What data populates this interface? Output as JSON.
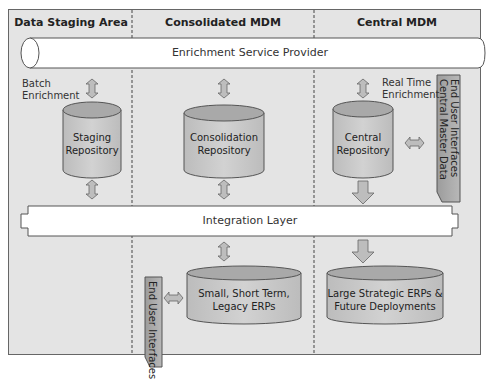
{
  "columns": [
    {
      "title": "Data Staging Area"
    },
    {
      "title": "Consolidated MDM"
    },
    {
      "title": "Central MDM"
    }
  ],
  "bars": {
    "enrichment": "Enrichment Service Provider",
    "integration": "Integration Layer"
  },
  "labels": {
    "batch_enrichment": [
      "Batch",
      "Enrichment"
    ],
    "real_time_enrichment": [
      "Real Time",
      "Enrichment"
    ]
  },
  "repositories": {
    "staging": [
      "Staging",
      "Repository"
    ],
    "consolidation": [
      "Consolidation",
      "Repository"
    ],
    "central": [
      "Central",
      "Repository"
    ],
    "small_erps": [
      "Small, Short Term,",
      "Legacy ERPs"
    ],
    "large_erps": [
      "Large Strategic ERPs &",
      "Future Deployments"
    ]
  },
  "interfaces": {
    "central": [
      "End User Interfaces",
      "Central Master Data"
    ],
    "consolidated": [
      "End User Interfaces"
    ]
  },
  "colors": {
    "panel_bg": "#e4e4e4",
    "cylinder_side": "#c8c8c8",
    "cylinder_top": "#a9a9a9",
    "interface_box": "#a8a8a8",
    "arrow_fill": "#bdbdbd",
    "border": "#555555"
  }
}
